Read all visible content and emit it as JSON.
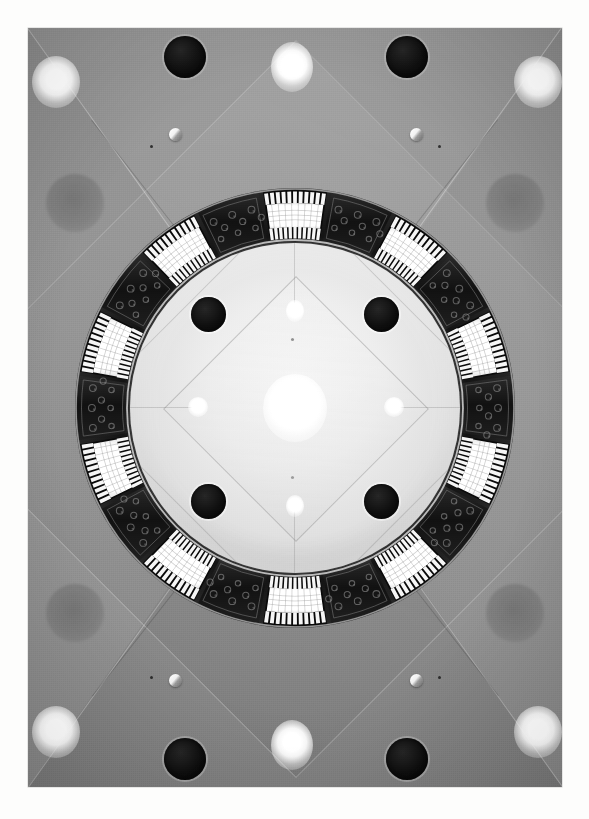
{
  "photo": {
    "title": "Illuminated circular dome ceiling",
    "description": "Black and white upward photograph of an interior ceiling: a bright circular dome ringed by alternating illuminated fluted-glass light panels and dark ornamental scrollwork panels, set within a square coffered ceiling with recessed spotlights, air vents and sprinkler heads.",
    "medium": "black-and-white photograph",
    "orientation": "portrait",
    "border_color": "#ffffff",
    "frame": {
      "left": 28,
      "top": 28,
      "width": 534,
      "height": 759
    }
  },
  "palette": {
    "paper_white": "#ffffff",
    "ceiling_grey": "#8f8f8d",
    "ceiling_grey_light": "#9a9a98",
    "ceiling_grey_dark": "#757574",
    "dome_highlight": "#f3f2ef",
    "dome_shadow": "#b3b1ab",
    "ornament_dark": "#1d1d1c",
    "ornament_mid": "#3a3a38",
    "lamp_white": "#ffffff",
    "vent_black": "#070707"
  },
  "scene": {
    "dome": {
      "label": "central dome",
      "diameter_px": 330,
      "finish": "smooth plaster, lit from the perimeter cove",
      "pattern": "concentric rotated squares (diamond) seams",
      "diamond_count": 2
    },
    "light_ring": {
      "label": "perimeter light ring",
      "outer_diameter_px": 440,
      "inner_diameter_px": 334,
      "segment_count": 20,
      "lamp_panel_count": 20,
      "ornament_panel_count": 20,
      "lamp_panel": {
        "name": "fluted glass light panel",
        "fill": "#ffffff",
        "rib_count": 9,
        "tooth_count": 11,
        "description": "vertically fluted bright glass panel with comb-toothed metal edges top and bottom"
      },
      "ornament_panel": {
        "name": "dark ornamental scroll panel",
        "fill": "#1d1d1c",
        "motif": "arabesque floral scrollwork",
        "scroll_count": 9
      }
    },
    "dome_vents": {
      "label": "dome air vents",
      "count": 4,
      "color": "#070707",
      "positions": [
        "upper-left",
        "upper-right",
        "lower-left",
        "lower-right"
      ]
    },
    "dome_spotlights": {
      "label": "dome recessed spotlights",
      "count": 5,
      "notes": "one large central spotlight plus four small points at top, bottom, left and right"
    },
    "outer_ceiling": {
      "label": "coffered outer ceiling",
      "geometry": "four sloped triangular planes meeting in a central diamond",
      "seam_color": "#c9c9c6",
      "corner_spotlights": 4,
      "edge_spotlights": 4,
      "outer_vents": 4,
      "grey_patches": 4,
      "sprinkler_heads": 4,
      "micro_fixtures": 4
    }
  },
  "light_ring_segments": [
    {
      "index": 1,
      "angle_deg": 0,
      "type": "lamp"
    },
    {
      "index": 2,
      "angle_deg": 18,
      "type": "ornament"
    },
    {
      "index": 3,
      "angle_deg": 36,
      "type": "lamp"
    },
    {
      "index": 4,
      "angle_deg": 54,
      "type": "ornament"
    },
    {
      "index": 5,
      "angle_deg": 72,
      "type": "lamp"
    },
    {
      "index": 6,
      "angle_deg": 90,
      "type": "ornament"
    },
    {
      "index": 7,
      "angle_deg": 108,
      "type": "lamp"
    },
    {
      "index": 8,
      "angle_deg": 126,
      "type": "ornament"
    },
    {
      "index": 9,
      "angle_deg": 144,
      "type": "lamp"
    },
    {
      "index": 10,
      "angle_deg": 162,
      "type": "ornament"
    },
    {
      "index": 11,
      "angle_deg": 180,
      "type": "lamp"
    },
    {
      "index": 12,
      "angle_deg": 198,
      "type": "ornament"
    },
    {
      "index": 13,
      "angle_deg": 216,
      "type": "lamp"
    },
    {
      "index": 14,
      "angle_deg": 234,
      "type": "ornament"
    },
    {
      "index": 15,
      "angle_deg": 252,
      "type": "lamp"
    },
    {
      "index": 16,
      "angle_deg": 270,
      "type": "ornament"
    },
    {
      "index": 17,
      "angle_deg": 288,
      "type": "lamp"
    },
    {
      "index": 18,
      "angle_deg": 306,
      "type": "ornament"
    },
    {
      "index": 19,
      "angle_deg": 324,
      "type": "lamp"
    },
    {
      "index": 20,
      "angle_deg": 342,
      "type": "ornament"
    }
  ],
  "caption": ""
}
